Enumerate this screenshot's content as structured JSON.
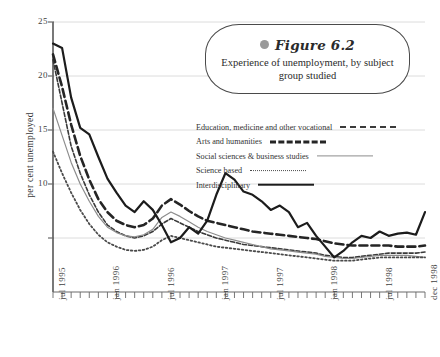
{
  "figure": {
    "marker_icon": "gray-bullet-icon",
    "number_label": "Figure 6.2",
    "caption": "Experience of unemployment, by subject group studied"
  },
  "chart_data": {
    "type": "line",
    "title": "Experience of unemployment, by subject group studied",
    "xlabel": "",
    "ylabel": "per cent unemployed",
    "ylim": [
      0,
      25
    ],
    "yticks": [
      5,
      10,
      15,
      20,
      25
    ],
    "ytick_labels": [
      "",
      "10",
      "15",
      "20",
      "25"
    ],
    "grid": true,
    "legend_position": "inside-right",
    "x_tick_labels": [
      "jul 1995",
      "jan 1996",
      "jul 1996",
      "jan 1997",
      "jul 1997",
      "jan 1998",
      "jul 1998",
      "dec 1998"
    ],
    "x_tick_positions": [
      0,
      6,
      12,
      18,
      24,
      30,
      36,
      41
    ],
    "x_minor_tick_count": 42,
    "x": [
      0,
      1,
      2,
      3,
      4,
      5,
      6,
      7,
      8,
      9,
      10,
      11,
      12,
      13,
      14,
      15,
      16,
      17,
      18,
      19,
      20,
      21,
      22,
      23,
      24,
      25,
      26,
      27,
      28,
      29,
      30,
      31,
      32,
      33,
      34,
      35,
      36,
      37,
      38,
      39,
      40,
      41
    ],
    "series": [
      {
        "name": "Education, medicine and other vocational",
        "style": "fine-dash",
        "color": "#3a3a3a",
        "values": [
          21.5,
          17.5,
          13.5,
          11.0,
          9.0,
          7.4,
          6.2,
          5.6,
          5.2,
          5.0,
          5.2,
          5.6,
          6.3,
          6.8,
          6.4,
          6.0,
          5.6,
          5.3,
          5.0,
          4.8,
          4.6,
          4.4,
          4.3,
          4.2,
          4.1,
          4.0,
          3.9,
          3.8,
          3.7,
          3.6,
          3.4,
          3.3,
          3.2,
          3.2,
          3.3,
          3.4,
          3.5,
          3.6,
          3.6,
          3.6,
          3.6,
          3.7
        ]
      },
      {
        "name": "Arts and humanities",
        "style": "thick-dash",
        "color": "#252525",
        "values": [
          22.0,
          19.0,
          15.5,
          12.6,
          10.4,
          8.6,
          7.4,
          6.6,
          6.2,
          6.0,
          6.2,
          6.8,
          8.0,
          8.6,
          8.1,
          7.5,
          7.0,
          6.6,
          6.4,
          6.2,
          6.0,
          5.8,
          5.6,
          5.5,
          5.4,
          5.3,
          5.2,
          5.1,
          5.0,
          4.9,
          4.7,
          4.5,
          4.4,
          4.3,
          4.3,
          4.3,
          4.3,
          4.3,
          4.2,
          4.2,
          4.2,
          4.3
        ]
      },
      {
        "name": "Social sciences & business studies",
        "style": "thin-solid",
        "color": "#8d8d8d",
        "values": [
          17.0,
          14.5,
          12.0,
          10.0,
          8.4,
          7.0,
          6.0,
          5.5,
          5.2,
          5.1,
          5.3,
          5.8,
          6.9,
          7.4,
          7.0,
          6.5,
          6.0,
          5.6,
          5.3,
          5.0,
          4.8,
          4.6,
          4.4,
          4.2,
          4.0,
          3.9,
          3.8,
          3.7,
          3.6,
          3.5,
          3.3,
          3.2,
          3.1,
          3.1,
          3.2,
          3.3,
          3.4,
          3.4,
          3.4,
          3.4,
          3.3,
          3.2
        ]
      },
      {
        "name": "Science based",
        "style": "dotted",
        "color": "#4a4a4a",
        "values": [
          13.0,
          11.0,
          9.2,
          7.6,
          6.3,
          5.3,
          4.6,
          4.2,
          3.9,
          3.8,
          3.9,
          4.2,
          4.8,
          5.2,
          5.0,
          4.8,
          4.6,
          4.4,
          4.2,
          4.1,
          4.0,
          3.9,
          3.8,
          3.7,
          3.6,
          3.5,
          3.4,
          3.3,
          3.2,
          3.1,
          3.0,
          2.9,
          2.9,
          2.9,
          3.0,
          3.1,
          3.2,
          3.2,
          3.2,
          3.2,
          3.2,
          3.2
        ]
      },
      {
        "name": "Interdisciplinary",
        "style": "thick-solid",
        "color": "#1c1c1c",
        "values": [
          23.0,
          22.6,
          18.0,
          15.2,
          14.6,
          12.5,
          10.5,
          9.2,
          8.0,
          7.4,
          8.4,
          7.6,
          6.2,
          4.6,
          5.0,
          6.0,
          5.4,
          6.6,
          9.0,
          11.0,
          10.4,
          9.3,
          9.0,
          8.4,
          7.6,
          8.0,
          7.4,
          6.0,
          6.4,
          5.2,
          4.2,
          3.2,
          3.8,
          4.6,
          5.2,
          5.0,
          5.6,
          5.2,
          5.4,
          5.5,
          5.3,
          7.4
        ]
      }
    ]
  },
  "legend": {
    "items": [
      {
        "label": "Education, medicine and other vocational",
        "sample_class": "s-edu"
      },
      {
        "label": "Arts and humanities",
        "sample_class": "s-arts"
      },
      {
        "label": "Social sciences & business studies",
        "sample_class": "s-soc"
      },
      {
        "label": "Science based",
        "sample_class": "s-sci"
      },
      {
        "label": "Interdisciplinary",
        "sample_class": "s-int"
      }
    ]
  }
}
